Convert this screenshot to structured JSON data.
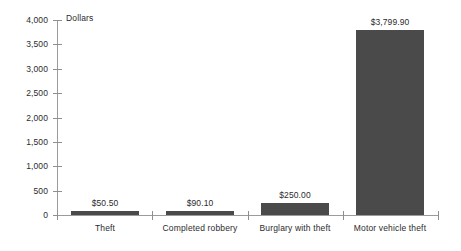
{
  "chart_data": {
    "type": "bar",
    "title": "",
    "subtitle": "",
    "xlabel": "",
    "ylabel": "Dollars",
    "ylim": [
      0,
      4000
    ],
    "ytick_step": 500,
    "grid": false,
    "legend": null,
    "bar_color": "#4a4a4a",
    "axis_color": "#9b9b9b",
    "background": "#ffffff",
    "categories": [
      "Theft",
      "Completed robbery",
      "Burglary with theft",
      "Motor vehicle theft"
    ],
    "values": [
      50.5,
      90.1,
      250.0,
      3799.9
    ],
    "value_labels": [
      "$50.50",
      "$90.10",
      "$250.00",
      "$3,799.90"
    ],
    "ytick_labels": [
      "0",
      "500",
      "1,000",
      "1,500",
      "2,000",
      "2,500",
      "3,000",
      "3,500",
      "4,000"
    ],
    "ytick_values": [
      0,
      500,
      1000,
      1500,
      2000,
      2500,
      3000,
      3500,
      4000
    ]
  },
  "axis": {
    "unit_label": "Dollars"
  }
}
